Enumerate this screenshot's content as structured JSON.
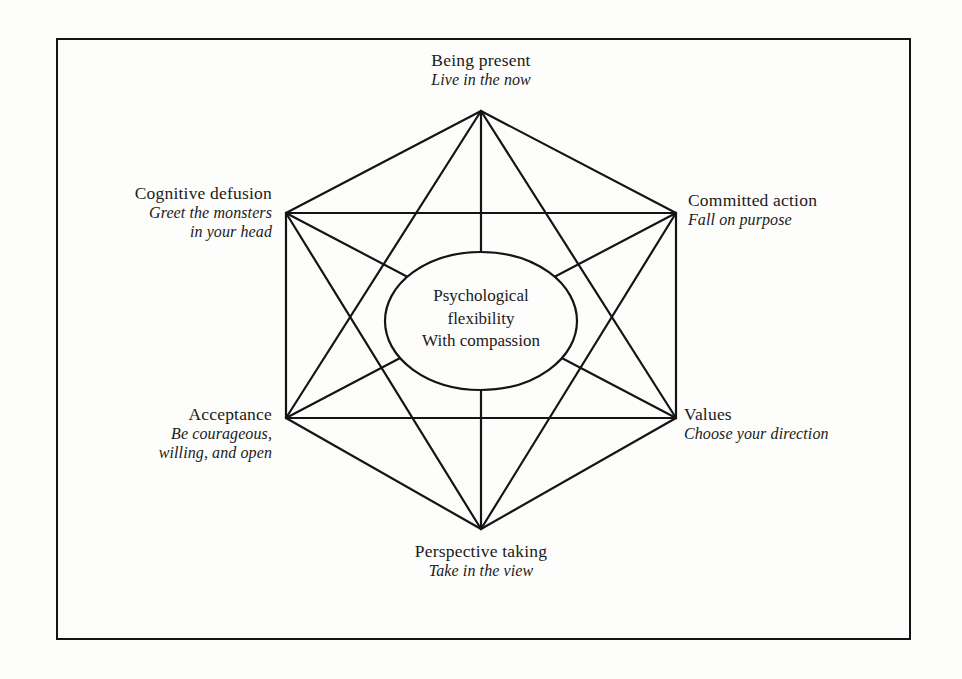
{
  "diagram": {
    "type": "act-hexaflex",
    "center": {
      "lines": [
        "Psychological",
        "flexibility",
        "With compassion"
      ]
    },
    "nodes": [
      {
        "id": "being-present",
        "title": "Being present",
        "subtitle": "Live in the now",
        "position": "top",
        "vertex": {
          "x": 481,
          "y": 111
        }
      },
      {
        "id": "committed-action",
        "title": "Committed action",
        "subtitle": "Fall on purpose",
        "position": "upper-right",
        "vertex": {
          "x": 676,
          "y": 213
        }
      },
      {
        "id": "values",
        "title": "Values",
        "subtitle": "Choose your direction",
        "position": "lower-right",
        "vertex": {
          "x": 676,
          "y": 418
        }
      },
      {
        "id": "perspective-taking",
        "title": "Perspective taking",
        "subtitle": "Take in the view",
        "position": "bottom",
        "vertex": {
          "x": 481,
          "y": 529
        }
      },
      {
        "id": "acceptance",
        "title": "Acceptance",
        "subtitle": "Be courageous,\nwilling, and open",
        "subtitle_line1": "Be courageous,",
        "subtitle_line2": "willing, and open",
        "position": "lower-left",
        "vertex": {
          "x": 286,
          "y": 418
        }
      },
      {
        "id": "cognitive-defusion",
        "title": "Cognitive defusion",
        "subtitle_line1": "Greet the monsters",
        "subtitle_line2": "in your head",
        "position": "upper-left",
        "vertex": {
          "x": 286,
          "y": 213
        }
      }
    ],
    "style": {
      "line_color": "#141414",
      "line_width": 2.2,
      "frame_color": "#141414",
      "background": "#fdfdfb",
      "ellipse_fill": "#fdfdfb"
    },
    "ellipse": {
      "cx": 481,
      "cy": 321,
      "rx": 96,
      "ry": 69
    }
  }
}
